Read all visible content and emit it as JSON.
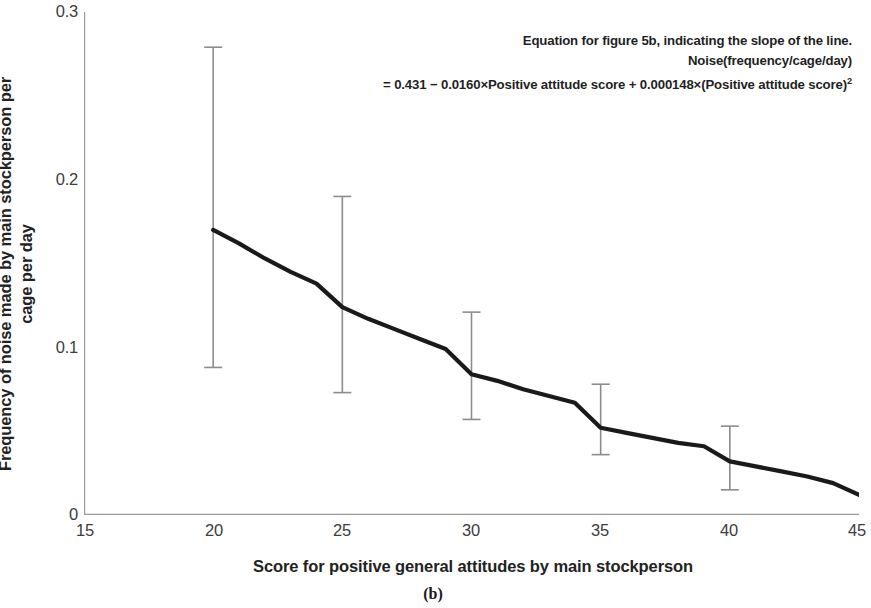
{
  "figure": {
    "caption": "(b)",
    "annotation": {
      "line1": "Equation for figure 5b, indicating the slope of the line.",
      "line2": "Noise(frequency/cage/day)",
      "line3_prefix": "= 0.431 − 0.0160×Positive attitude score + 0.000148×(Positive attitude score)",
      "line3_exponent": "2"
    }
  },
  "chart_data": {
    "type": "line",
    "title": "",
    "subtitle": "",
    "xlabel": "Score for positive general attitudes by main stockperson",
    "ylabel": "Frequency of noise made by main stockperson per\ncage per day",
    "xlim": [
      15,
      45
    ],
    "ylim": [
      0,
      0.3
    ],
    "xticks": [
      15,
      20,
      25,
      30,
      35,
      40,
      45
    ],
    "xtick_labels": [
      "15",
      "20",
      "25",
      "30",
      "35",
      "40",
      "45"
    ],
    "yticks": [
      0,
      0.1,
      0.2,
      0.3
    ],
    "ytick_labels": [
      "0",
      "0.1",
      "0.2",
      "0.3"
    ],
    "grid": false,
    "legend": null,
    "line_color": "#1a1a1a",
    "errorbar_color": "#8c8c8c",
    "axis_color": "#9a9a9a",
    "equation": "Noise(frequency/cage/day) = 0.431 - 0.0160*x + 0.000148*x^2",
    "fit": {
      "intercept": 0.431,
      "linear": -0.016,
      "quadratic": 0.000148
    },
    "x": [
      20,
      21,
      22,
      23,
      24,
      25,
      26,
      27,
      28,
      29,
      30,
      31,
      32,
      33,
      34,
      35,
      36,
      37,
      38,
      39,
      40,
      41,
      42,
      43,
      44,
      45
    ],
    "values": [
      0.17,
      0.162,
      0.153,
      0.145,
      0.138,
      0.124,
      0.117,
      0.111,
      0.105,
      0.099,
      0.084,
      0.08,
      0.075,
      0.071,
      0.067,
      0.052,
      0.049,
      0.046,
      0.043,
      0.041,
      0.032,
      0.029,
      0.026,
      0.023,
      0.019,
      0.012
    ],
    "errorbars": [
      {
        "x": 20,
        "y": 0.17,
        "upper": 0.279,
        "lower": 0.088
      },
      {
        "x": 25,
        "y": 0.124,
        "upper": 0.19,
        "lower": 0.073
      },
      {
        "x": 30,
        "y": 0.084,
        "upper": 0.121,
        "lower": 0.057
      },
      {
        "x": 35,
        "y": 0.052,
        "upper": 0.078,
        "lower": 0.036
      },
      {
        "x": 40,
        "y": 0.032,
        "upper": 0.053,
        "lower": 0.015
      }
    ]
  }
}
